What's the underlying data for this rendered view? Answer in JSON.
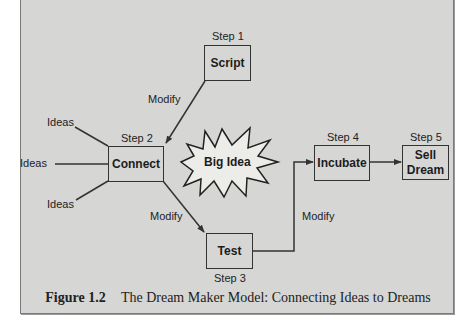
{
  "diagram": {
    "nodes": {
      "script": {
        "step": "Step 1",
        "label": "Script"
      },
      "connect": {
        "step": "Step 2",
        "label": "Connect"
      },
      "test": {
        "step": "Step 3",
        "label": "Test"
      },
      "incubate": {
        "step": "Step 4",
        "label": "Incubate"
      },
      "sell_dream": {
        "step": "Step 5",
        "label": "Sell\nDream",
        "label_line1": "Sell",
        "label_line2": "Dream"
      }
    },
    "inputs": [
      "Ideas",
      "Ideas",
      "Ideas"
    ],
    "center_label": "Big Idea",
    "edge_labels": {
      "script_to_connect": "Modify",
      "connect_to_test": "Modify",
      "test_to_incubate": "Modify"
    },
    "edges": [
      {
        "from": "Ideas",
        "to": "Connect"
      },
      {
        "from": "Ideas",
        "to": "Connect"
      },
      {
        "from": "Ideas",
        "to": "Connect"
      },
      {
        "from": "Script",
        "to": "Connect",
        "label": "Modify"
      },
      {
        "from": "Connect",
        "to": "Test",
        "label": "Modify"
      },
      {
        "from": "Test",
        "to": "Incubate",
        "label": "Modify"
      },
      {
        "from": "Incubate",
        "to": "Sell Dream"
      }
    ]
  },
  "caption": {
    "figure_number": "Figure 1.2",
    "text": "The Dream Maker Model: Connecting Ideas to Dreams"
  },
  "colors": {
    "panel": "#d6d6d4",
    "stroke": "#333333",
    "text": "#1c1c1c"
  }
}
